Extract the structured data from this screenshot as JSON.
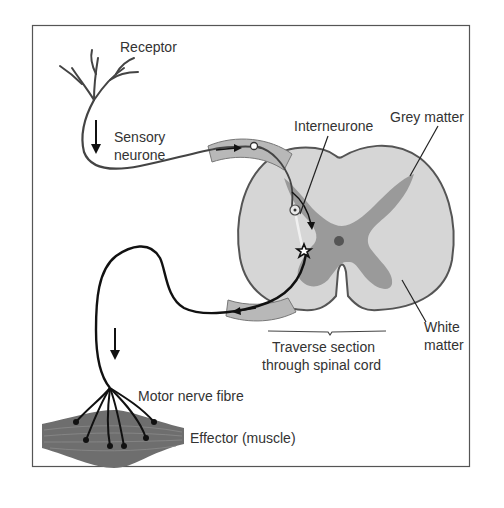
{
  "diagram": {
    "labels": {
      "receptor": "Receptor",
      "sensory_line1": "Sensory",
      "sensory_line2": "neurone",
      "interneurone": "Interneurone",
      "grey_matter": "Grey matter",
      "white_line1": "White",
      "white_line2": "matter",
      "section_line1": "Traverse section",
      "section_line2": "through spinal cord",
      "motor": "Motor nerve fibre",
      "effector": "Effector (muscle)"
    },
    "colors": {
      "border": "#555555",
      "white_matter": "#d6d6d6",
      "grey_matter": "#9a9a9a",
      "nerve_root": "#b8b8b8",
      "muscle": "#6e6e6e",
      "sensory_line": "#444444",
      "motor_line": "#111111"
    }
  }
}
